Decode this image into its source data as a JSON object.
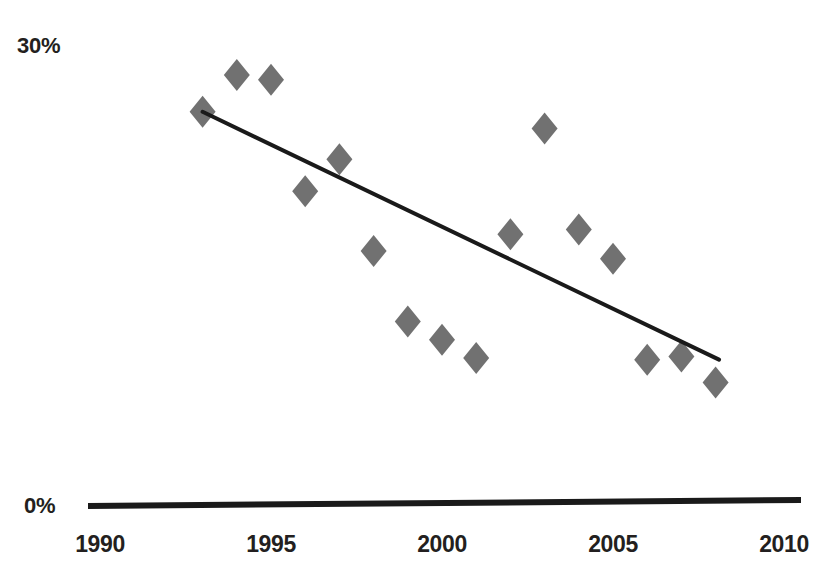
{
  "chart_data": {
    "type": "scatter",
    "title": "",
    "subtitle": "",
    "xlabel": "",
    "ylabel": "",
    "xlim": [
      1989,
      2011
    ],
    "ylim": [
      0,
      30
    ],
    "grid": false,
    "legend": null,
    "marker": "diamond",
    "marker_color": "#717171",
    "trendline_color": "#1a1a1a",
    "axis_color": "#1a1a1a",
    "x_tick_labels": [
      "1990",
      "1995",
      "2000",
      "2005",
      "2010"
    ],
    "x_ticks": [
      1990,
      1995,
      2000,
      2005,
      2010
    ],
    "y_tick_labels": [
      "0%",
      "30%"
    ],
    "y_ticks": [
      0,
      30
    ],
    "series": [
      {
        "name": "observations",
        "x": [
          1993,
          1994,
          1995,
          1996,
          1997,
          1998,
          1999,
          2000,
          2001,
          2002,
          2003,
          2004,
          2005,
          2006,
          2007,
          2008
        ],
        "values": [
          25.7,
          28.1,
          27.8,
          20.5,
          22.6,
          16.6,
          12.0,
          10.8,
          9.6,
          17.7,
          24.6,
          18.0,
          16.1,
          9.5,
          9.7,
          8.0
        ]
      }
    ],
    "trendline": {
      "name": "linear trend",
      "x_start": 1993,
      "y_start": 25.7,
      "x_end": 2008.1,
      "y_end": 9.5
    },
    "annotations": []
  }
}
